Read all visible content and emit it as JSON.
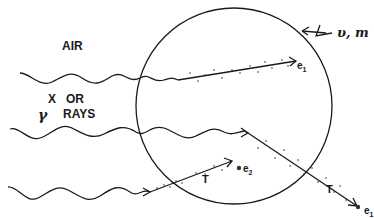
{
  "diagram": {
    "labels": {
      "medium": "AIR",
      "radiation_line1": "X   OR",
      "radiation_line2_symbol": "γ",
      "radiation_line2": "RAYS",
      "sphere_params": "υ, m",
      "electron_1_top": "e",
      "electron_1_top_sub": "1",
      "electron_2": "e",
      "electron_2_sub": "2",
      "electron_1_bottom": "e",
      "electron_1_bottom_sub": "1",
      "track_label_1": "T",
      "track_label_2": "T"
    },
    "elements": {
      "sphere": {
        "shape": "circle",
        "cx": 234,
        "cy": 106,
        "r": 98
      },
      "photon_paths": 3,
      "electron_tracks": 3
    },
    "colors": {
      "line": "#1a1a1a",
      "background": "#ffffff"
    }
  }
}
